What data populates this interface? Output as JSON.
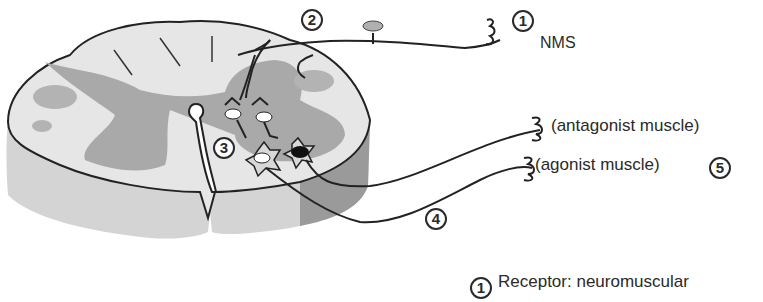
{
  "figure": {
    "colors": {
      "white_matter": "#e6e6e6",
      "gray_matter": "#a9a9a9",
      "side_face": "#d4d4d4",
      "side_face_dark": "#8f8f8f",
      "outline": "#222222",
      "inhibitory_neuron": "#111111",
      "ganglion": "#b0b0b0"
    },
    "markers": [
      {
        "id": "1",
        "label": "1"
      },
      {
        "id": "2",
        "label": "2"
      },
      {
        "id": "3",
        "label": "3"
      },
      {
        "id": "4",
        "label": "4"
      },
      {
        "id": "5",
        "label": "5"
      }
    ],
    "labels": {
      "nms": "NMS",
      "antagonist": "(antagonist muscle)",
      "agonist": "(agonist muscle)",
      "legend_item_1": "Receptor: neuromuscular"
    },
    "legend": [
      {
        "marker": "1",
        "text": "Receptor: neuromuscular"
      }
    ]
  }
}
